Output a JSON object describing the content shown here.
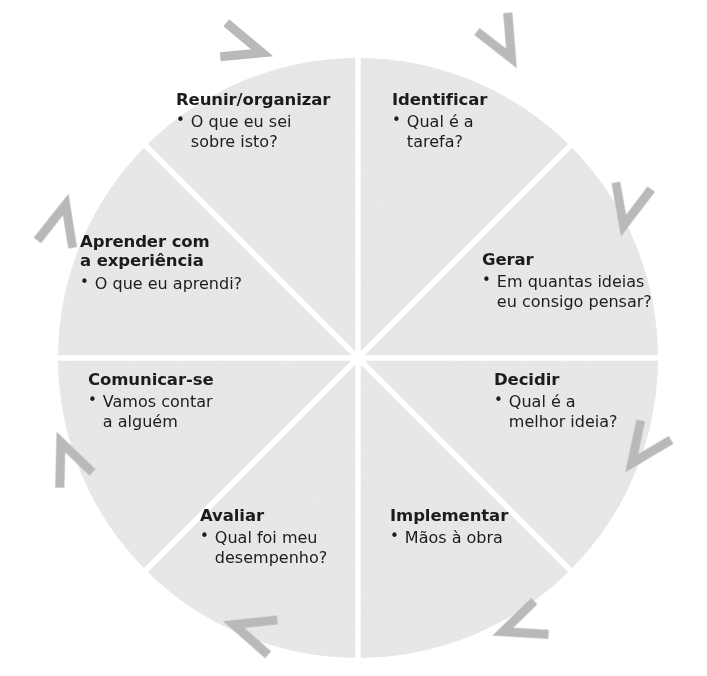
{
  "diagram": {
    "type": "cycle-wheel",
    "segment_count": 8,
    "direction": "clockwise",
    "colors": {
      "segment_fill": "#e9e9e9",
      "divider": "#ffffff",
      "arrow": "#b9b9b9",
      "text": "#1c1c1c",
      "background": "#ffffff"
    },
    "geometry": {
      "center_x": 358,
      "center_y": 358,
      "radius": 300
    },
    "segments": [
      {
        "id": "identificar",
        "title": "Identificar",
        "bullet": "Qual é a\ntarefa?",
        "order": 1
      },
      {
        "id": "gerar",
        "title": "Gerar",
        "bullet": "Em quantas ideias\neu consigo pensar?",
        "order": 2
      },
      {
        "id": "decidir",
        "title": "Decidir",
        "bullet": "Qual é a\nmelhor ideia?",
        "order": 3
      },
      {
        "id": "implementar",
        "title": "Implementar",
        "bullet": "Mãos à obra",
        "order": 4
      },
      {
        "id": "avaliar",
        "title": "Avaliar",
        "bullet": "Qual foi meu\ndesempenho?",
        "order": 5
      },
      {
        "id": "comunicar-se",
        "title": "Comunicar-se",
        "bullet": "Vamos contar\na alguém",
        "order": 6
      },
      {
        "id": "aprender-com-a-experiencia",
        "title": "Aprender com\na experiência",
        "bullet": "O que eu aprendi?",
        "order": 7
      },
      {
        "id": "reunir-organizar",
        "title": "Reunir/organizar",
        "bullet": "O que eu sei\nsobre isto?",
        "order": 8
      }
    ],
    "bullet_glyph": "•",
    "arrows": [
      {
        "id": "arrow-top-left",
        "angle_deg": 292
      },
      {
        "id": "arrow-top-right",
        "angle_deg": 338
      },
      {
        "id": "arrow-right-upper",
        "angle_deg": 23
      },
      {
        "id": "arrow-right-lower",
        "angle_deg": 68
      },
      {
        "id": "arrow-bottom-right",
        "angle_deg": 113
      },
      {
        "id": "arrow-bottom-left",
        "angle_deg": 158
      },
      {
        "id": "arrow-left-lower",
        "angle_deg": 203
      },
      {
        "id": "arrow-left-upper",
        "angle_deg": 248
      }
    ]
  }
}
